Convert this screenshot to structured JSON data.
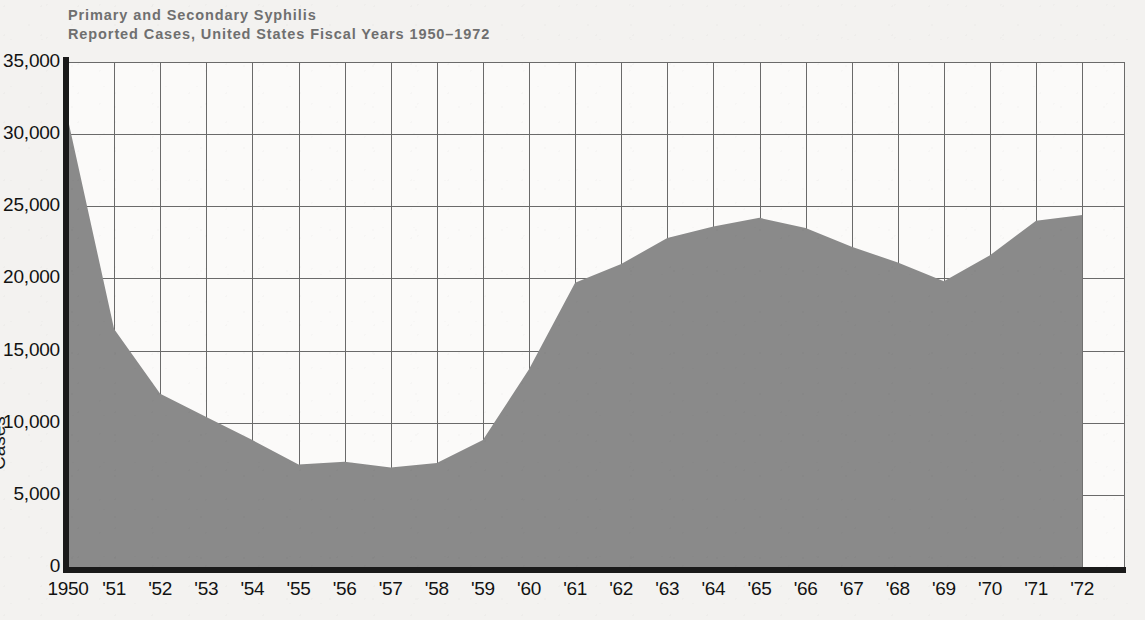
{
  "chart_data": {
    "type": "area",
    "title": "Primary and Secondary Syphilis Reported Cases, United States Fiscal Years 1950–1972",
    "title_lines": [
      "Primary and Secondary Syphilis",
      "Reported Cases, United States Fiscal Years 1950–1972"
    ],
    "xlabel": "",
    "ylabel": "Cases",
    "ylim": [
      0,
      35000
    ],
    "xlim": [
      "1950",
      "1972"
    ],
    "grid": true,
    "legend": "none",
    "y_ticks": [
      0,
      5000,
      10000,
      15000,
      20000,
      25000,
      30000,
      35000
    ],
    "y_tick_labels": [
      "0",
      "5,000",
      "10,000",
      "15,000",
      "20,000",
      "25,000",
      "30,000",
      "35,000"
    ],
    "categories": [
      "1950",
      "'51",
      "'52",
      "'53",
      "'54",
      "'55",
      "'56",
      "'57",
      "'58",
      "'59",
      "'60",
      "'61",
      "'62",
      "'63",
      "'64",
      "'65",
      "'66",
      "'67",
      "'68",
      "'69",
      "'70",
      "'71",
      "'72"
    ],
    "x_values": [
      1950,
      1951,
      1952,
      1953,
      1954,
      1955,
      1956,
      1957,
      1958,
      1959,
      1960,
      1961,
      1962,
      1963,
      1964,
      1965,
      1966,
      1967,
      1968,
      1969,
      1970,
      1971,
      1972
    ],
    "values": [
      31000,
      16500,
      12000,
      10400,
      8800,
      7100,
      7300,
      6900,
      7200,
      8800,
      13700,
      19700,
      21000,
      22800,
      23600,
      24200,
      23500,
      22200,
      21100,
      19800,
      21600,
      24000,
      24400
    ],
    "series": [
      {
        "name": "Primary and Secondary Syphilis Reported Cases",
        "values": [
          31000,
          16500,
          12000,
          10400,
          8800,
          7100,
          7300,
          6900,
          7200,
          8800,
          13700,
          19700,
          21000,
          22800,
          23600,
          24200,
          23500,
          22200,
          21100,
          19800,
          21600,
          24000,
          24400
        ]
      }
    ],
    "colors": {
      "area_fill": "#8a8a8a",
      "grid": "#6a6a6a",
      "axis": "#1a1a1a",
      "plot_background": "#fbfaf9",
      "page_background": "#f3f2f0",
      "title_text": "#6f6f6f",
      "tick_text": "#121212"
    }
  }
}
